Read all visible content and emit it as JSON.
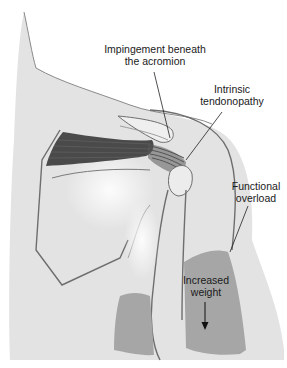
{
  "diagram": {
    "colors": {
      "background": "#ffffff",
      "body_fill": "#e3e3e3",
      "body_highlight": "#f4f4f4",
      "outline": "#6e6e6e",
      "muscle_dark": "#4a4a4a",
      "weight_region": "#a6a6a6",
      "leader_line": "#222222",
      "text": "#1a1a1a"
    },
    "labels": {
      "impingement": {
        "line1": "Impingement beneath",
        "line2": "the acromion"
      },
      "intrinsic": {
        "line1": "Intrinsic",
        "line2": "tendonopathy"
      },
      "functional": {
        "line1": "Functional",
        "line2": "overload"
      },
      "weight": {
        "line1": "Increased",
        "line2": "weight"
      }
    },
    "arrows": {
      "weight_arrow": "down-arrow"
    }
  }
}
